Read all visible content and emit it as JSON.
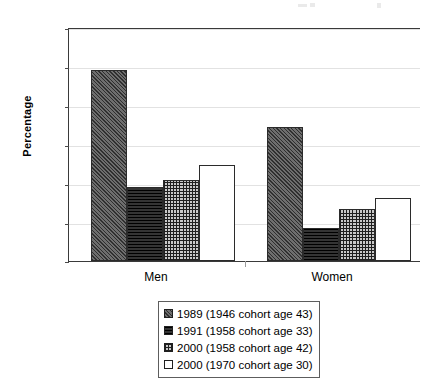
{
  "chart_data": {
    "type": "bar",
    "title": "",
    "subtitle": "",
    "xlabel": "",
    "ylabel": "Percentage",
    "ylim": [
      0,
      60
    ],
    "yticks": [
      0,
      10,
      20,
      30,
      40,
      50,
      60
    ],
    "ytick_labels": [
      "0",
      "10",
      "20",
      "30",
      "40",
      "50",
      "60"
    ],
    "grid": true,
    "grid_axis": "y",
    "legend_position": "below-center",
    "categories": [
      "Men",
      "Women"
    ],
    "series": [
      {
        "name": "1989 (1946 cohort age 43)",
        "pattern": "diagonal-hatch",
        "values": [
          49.0,
          34.3
        ]
      },
      {
        "name": "1991 (1958 cohort age 33)",
        "pattern": "solid-dark",
        "values": [
          18.9,
          8.5
        ]
      },
      {
        "name": "2000 (1958 cohort age 42)",
        "pattern": "cross-hatch",
        "values": [
          20.7,
          13.4
        ]
      },
      {
        "name": "2000 (1970 cohort age 30)",
        "pattern": "white",
        "values": [
          24.5,
          16.2
        ]
      }
    ]
  },
  "axes": {
    "y_title": "Percentage",
    "tick_0": "0",
    "tick_10": "10",
    "tick_20": "20",
    "tick_30": "30",
    "tick_40": "40",
    "tick_50": "50",
    "tick_60": "60",
    "cat_men": "Men",
    "cat_women": "Women"
  },
  "legend": {
    "items": [
      {
        "label": "1989 (1946 cohort age 43)"
      },
      {
        "label": "1991 (1958 cohort age 33)"
      },
      {
        "label": "2000 (1958 cohort age 42)"
      },
      {
        "label": "2000 (1970 cohort age 30)"
      }
    ]
  }
}
